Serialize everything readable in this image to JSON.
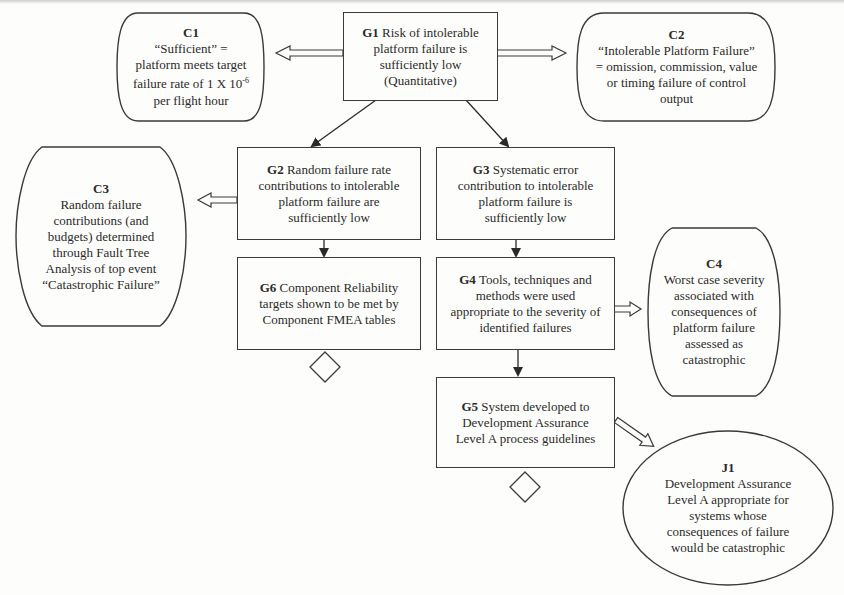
{
  "diagram": {
    "type": "Goal Structuring Notation (GSN) safety argument",
    "nodes": {
      "G1": {
        "id": "G1",
        "kind": "goal",
        "text": "Risk of intolerable platform failure is sufficiently low (Quantitative)",
        "lines": [
          "Risk of intolerable",
          "platform failure is",
          "sufficiently low",
          "(Quantitative)"
        ]
      },
      "C1": {
        "id": "C1",
        "kind": "context",
        "lines": [
          "“Sufficient” =",
          "platform meets target",
          "failure rate of 1 X 10",
          "per flight hour"
        ],
        "exponent": "-6"
      },
      "C2": {
        "id": "C2",
        "kind": "context",
        "lines": [
          "“Intolerable Platform Failure”",
          "= omission, commission, value",
          "or timing failure of control",
          "output"
        ]
      },
      "G2": {
        "id": "G2",
        "kind": "goal",
        "lines": [
          "Random failure rate",
          "contributions to intolerable",
          "platform failure are",
          "sufficiently low"
        ]
      },
      "G3": {
        "id": "G3",
        "kind": "goal",
        "lines": [
          "Systematic error",
          "contribution to intolerable",
          "platform failure is",
          "sufficiently low"
        ]
      },
      "C3": {
        "id": "C3",
        "kind": "context",
        "lines": [
          "Random failure",
          "contributions (and",
          "budgets) determined",
          "through Fault Tree",
          "Analysis of top event",
          "“Catastrophic Failure”"
        ]
      },
      "G6": {
        "id": "G6",
        "kind": "goal",
        "lines": [
          "Component Reliability",
          "targets shown to be met by",
          "Component FMEA tables"
        ]
      },
      "G4": {
        "id": "G4",
        "kind": "goal",
        "lines": [
          "Tools, techniques and",
          "methods were used",
          "appropriate to the severity of",
          "identified failures"
        ]
      },
      "C4": {
        "id": "C4",
        "kind": "context",
        "lines": [
          "Worst case severity",
          "associated with",
          "consequences of",
          "platform failure",
          "assessed as",
          "catastrophic"
        ]
      },
      "G5": {
        "id": "G5",
        "kind": "goal",
        "lines": [
          "System developed to",
          "Development Assurance",
          "Level A process guidelines"
        ]
      },
      "J1": {
        "id": "J1",
        "kind": "justification",
        "lines": [
          "Development Assurance",
          "Level A appropriate for",
          "systems whose",
          "consequences of failure",
          "would be catastrophic"
        ]
      }
    },
    "edges": [
      {
        "from": "G1",
        "to": "C1",
        "type": "in-context-of"
      },
      {
        "from": "G1",
        "to": "C2",
        "type": "in-context-of"
      },
      {
        "from": "G1",
        "to": "G2",
        "type": "supported-by"
      },
      {
        "from": "G1",
        "to": "G3",
        "type": "supported-by"
      },
      {
        "from": "G2",
        "to": "C3",
        "type": "in-context-of"
      },
      {
        "from": "G2",
        "to": "G6",
        "type": "supported-by"
      },
      {
        "from": "G3",
        "to": "G4",
        "type": "supported-by"
      },
      {
        "from": "G4",
        "to": "C4",
        "type": "in-context-of"
      },
      {
        "from": "G4",
        "to": "G5",
        "type": "supported-by"
      },
      {
        "from": "G5",
        "to": "J1",
        "type": "in-context-of"
      }
    ],
    "undeveloped": [
      "G6",
      "G5"
    ],
    "colors": {
      "stroke": "#3a3a3a",
      "background": "#fdfdfb",
      "text": "#2a2a2a"
    }
  }
}
